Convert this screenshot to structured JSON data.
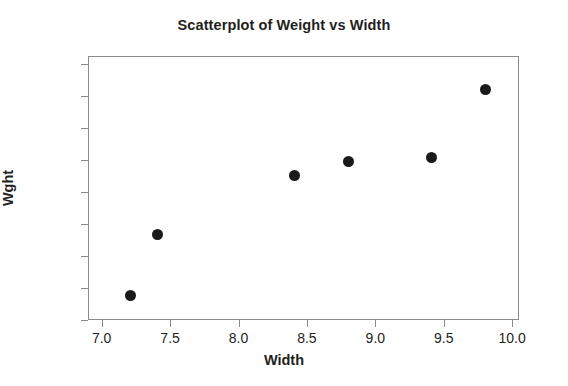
{
  "chart_data": {
    "type": "scatter",
    "title": "Scatterplot of Weight vs Width",
    "xlabel": "Width",
    "ylabel": "Wght",
    "xlim": [
      6.9,
      10.05
    ],
    "ylim": [
      100,
      265
    ],
    "xticks": [
      "7.0",
      "7.5",
      "8.0",
      "8.5",
      "9.0",
      "9.5",
      "10.0"
    ],
    "xtick_values": [
      7.0,
      7.5,
      8.0,
      8.5,
      9.0,
      9.5,
      10.0
    ],
    "yticks": [
      "100",
      "120",
      "140",
      "160",
      "180",
      "200",
      "220",
      "240",
      "260"
    ],
    "ytick_values": [
      100,
      120,
      140,
      160,
      180,
      200,
      220,
      240,
      260
    ],
    "grid": false,
    "legend": "none",
    "marker": "filled-circle",
    "marker_color": "#1a1a1a",
    "frame_color": "#8c8c8c",
    "background": "#ffffff",
    "x": [
      7.2,
      7.4,
      8.4,
      8.8,
      9.4,
      9.8
    ],
    "y": [
      116,
      154,
      191,
      200,
      202,
      245
    ],
    "points": [
      {
        "x": 7.2,
        "y": 116
      },
      {
        "x": 7.4,
        "y": 154
      },
      {
        "x": 8.4,
        "y": 191
      },
      {
        "x": 8.8,
        "y": 200
      },
      {
        "x": 9.4,
        "y": 202
      },
      {
        "x": 9.8,
        "y": 245
      }
    ]
  }
}
